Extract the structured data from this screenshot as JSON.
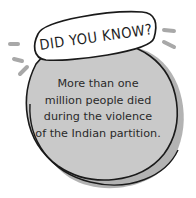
{
  "callout": {
    "heading": "DID YOU KNOW?",
    "lines": [
      "More than one",
      "million people died",
      "during the violence",
      "of the Indian partition."
    ]
  },
  "colors": {
    "circle_fill": "#c9c9c9",
    "shadow_fill": "#b3b3b3",
    "outline": "#1a1a1a",
    "banner_fill": "#ffffff",
    "dash_marks": "#a8a8a8"
  }
}
